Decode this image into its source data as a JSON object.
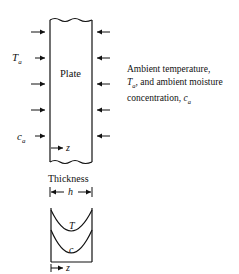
{
  "diagram": {
    "plate_label": "Plate",
    "left_labels": {
      "temperature": "T",
      "temperature_sub": "a",
      "moisture": "c",
      "moisture_sub": "a"
    },
    "axis_label": "z",
    "thickness_label": "Thickness",
    "thickness_symbol": "h",
    "profile_labels": [
      "T",
      "c"
    ],
    "caption": {
      "line1": "Ambient temperature,",
      "line2_sym": "T",
      "line2_sub": "a",
      "line2_rest": ", and ambient moisture",
      "line3": "concentration, ",
      "line3_sym": "c",
      "line3_sub": "a"
    },
    "arrow_rows_y": [
      32,
      58,
      84,
      110,
      136
    ]
  }
}
